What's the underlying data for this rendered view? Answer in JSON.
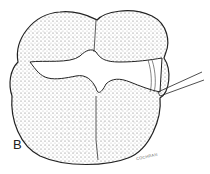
{
  "figure": {
    "panel_label": "B",
    "signature": "COCHRAN",
    "colors": {
      "outline": "#222222",
      "stipple": "#555555",
      "background": "#ffffff"
    }
  }
}
